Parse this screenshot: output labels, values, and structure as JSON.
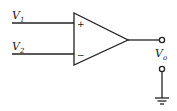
{
  "diagram": {
    "type": "op-amp",
    "inputs": [
      {
        "label": "V",
        "subscript": "1",
        "terminal": "+"
      },
      {
        "label": "V",
        "subscript": "2",
        "terminal": "−"
      }
    ],
    "output": {
      "label": "V",
      "subscript": "o"
    },
    "ground": true,
    "line_color": "#222222"
  }
}
